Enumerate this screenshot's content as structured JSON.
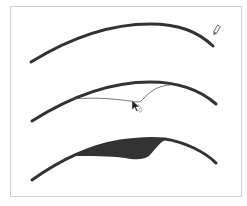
{
  "figure": {
    "panels": [
      {
        "id": "step-1",
        "description": "Curve with pencil tool",
        "tool_icon": "pencil-icon"
      },
      {
        "id": "step-2",
        "description": "Curve with hand-drawn stroke and arrow cursor",
        "tool_icon": "arrow-cursor-icon"
      },
      {
        "id": "step-3",
        "description": "Curve with filled shape"
      }
    ],
    "colors": {
      "stroke": "#333333",
      "fill": "#333333",
      "thin_stroke": "#444444",
      "frame_border": "#cfcfcf",
      "background": "#ffffff"
    },
    "caption": ""
  }
}
